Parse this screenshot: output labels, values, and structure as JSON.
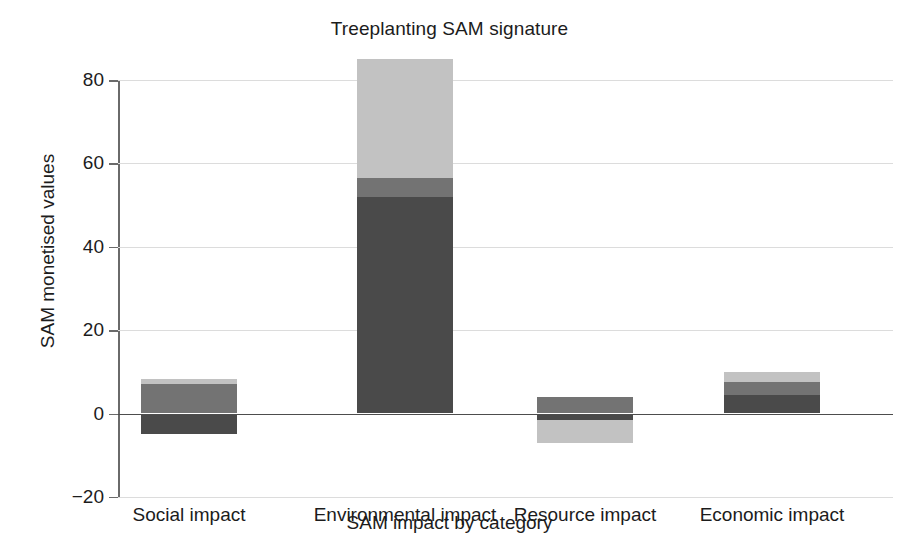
{
  "chart_data": {
    "type": "bar",
    "title": "Treeplanting SAM signature",
    "xlabel": "SAM impact by category",
    "ylabel": "SAM monetised values",
    "categories": [
      "Social impact",
      "Environmental impact",
      "Resource impact",
      "Economic impact"
    ],
    "yticks": [
      80,
      60,
      40,
      20,
      0,
      -20
    ],
    "ytick_labels": [
      "80",
      "60",
      "40",
      "20",
      "0",
      "−20"
    ],
    "ylim": [
      -20,
      85
    ],
    "grid": true,
    "legend": "none",
    "stacked": true,
    "series": [
      {
        "name": "dark segment",
        "color": "#4a4a4a",
        "values": [
          -5.0,
          52.0,
          -1.5,
          4.5
        ]
      },
      {
        "name": "medium segment",
        "color": "#737373",
        "values": [
          7.0,
          4.5,
          4.0,
          3.0
        ]
      },
      {
        "name": "light segment",
        "color": "#c2c2c2",
        "values": [
          1.2,
          28.5,
          -5.5,
          2.5
        ]
      }
    ],
    "bars": [
      {
        "category": "Social impact",
        "total_positive": 8.2,
        "total_negative": -5.0,
        "segments": [
          {
            "shade": "light",
            "color": "#c2c2c2",
            "from": 7.0,
            "to": 8.2
          },
          {
            "shade": "medium",
            "color": "#737373",
            "from": 0.0,
            "to": 7.0
          },
          {
            "shade": "dark",
            "color": "#4a4a4a",
            "from": -5.0,
            "to": 0.0
          }
        ]
      },
      {
        "category": "Environmental impact",
        "total_positive": 85.0,
        "total_negative": 0.0,
        "segments": [
          {
            "shade": "light",
            "color": "#c2c2c2",
            "from": 56.5,
            "to": 85.0
          },
          {
            "shade": "medium",
            "color": "#737373",
            "from": 52.0,
            "to": 56.5
          },
          {
            "shade": "dark",
            "color": "#4a4a4a",
            "from": 0.0,
            "to": 52.0
          }
        ]
      },
      {
        "category": "Resource impact",
        "total_positive": 4.0,
        "total_negative": -7.0,
        "segments": [
          {
            "shade": "medium",
            "color": "#737373",
            "from": 0.0,
            "to": 4.0
          },
          {
            "shade": "dark",
            "color": "#4a4a4a",
            "from": -1.5,
            "to": 0.0
          },
          {
            "shade": "light",
            "color": "#c2c2c2",
            "from": -7.0,
            "to": -1.5
          }
        ]
      },
      {
        "category": "Economic impact",
        "total_positive": 10.0,
        "total_negative": 0.0,
        "segments": [
          {
            "shade": "light",
            "color": "#c2c2c2",
            "from": 7.5,
            "to": 10.0
          },
          {
            "shade": "medium",
            "color": "#737373",
            "from": 4.5,
            "to": 7.5
          },
          {
            "shade": "dark",
            "color": "#4a4a4a",
            "from": 0.0,
            "to": 4.5
          }
        ]
      }
    ]
  },
  "colors": {
    "dark": "#4a4a4a",
    "medium": "#737373",
    "light": "#c2c2c2",
    "axis": "#4d4d4d",
    "grid": "#dcdcdc",
    "text": "#1c1c1c",
    "background": "#ffffff"
  }
}
